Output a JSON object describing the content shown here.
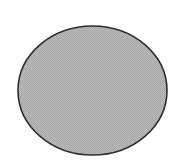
{
  "figure": {
    "shape": "ellipse",
    "center": {
      "x": 92.5,
      "y": 90.5
    },
    "radius": {
      "x": 74.5,
      "y": 64.5
    },
    "fill_color": "#b9b9b9",
    "fill_texture_color": "#a9a9a9",
    "stroke_color": "#2e2e2e",
    "stroke_width": 1.6,
    "background_color": "#ffffff"
  }
}
